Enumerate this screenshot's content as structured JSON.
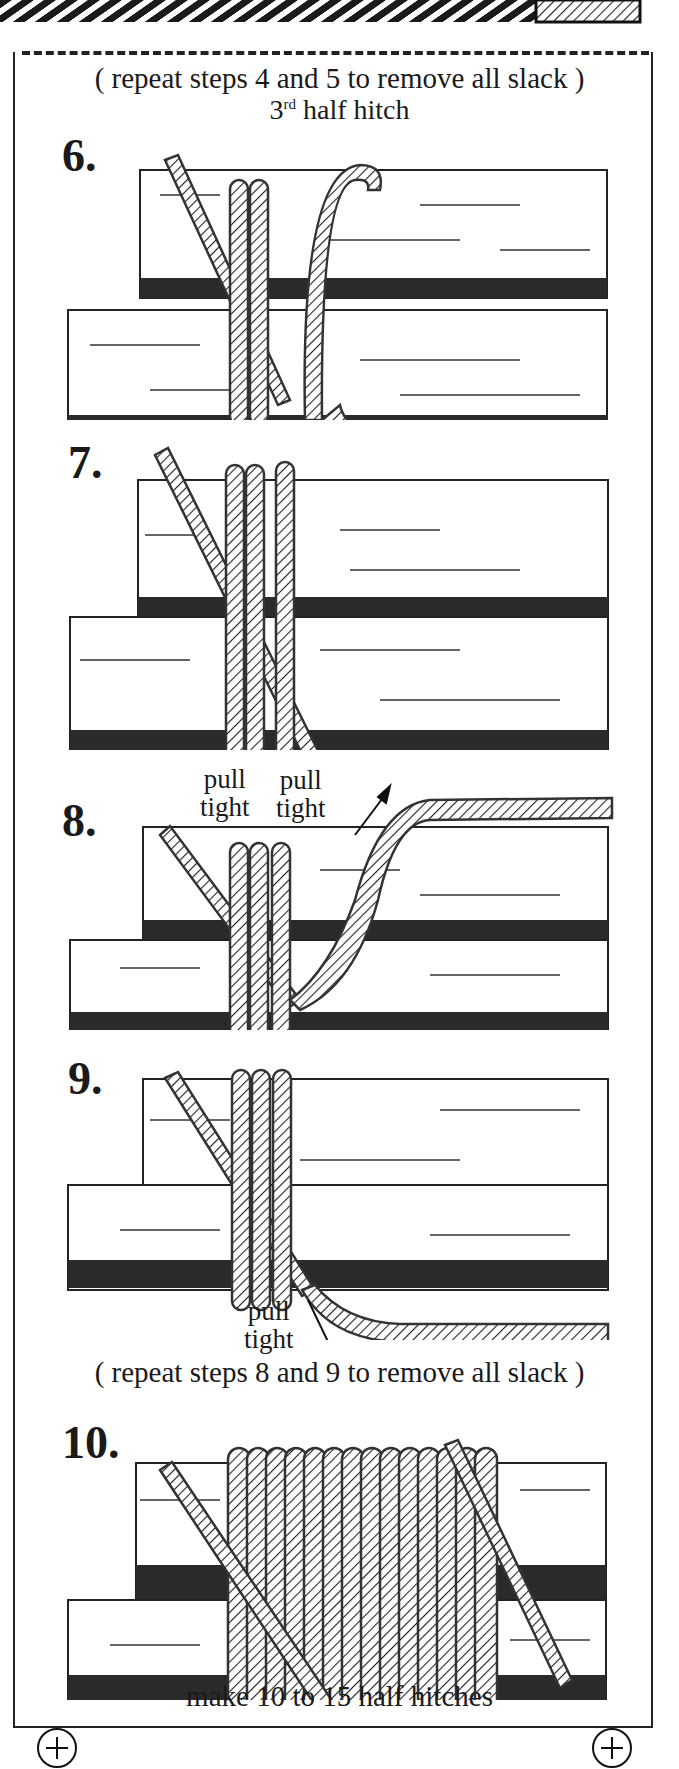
{
  "header": {
    "repeat_note": "( repeat steps 4 and 5 to remove all slack )",
    "subtitle_base": "3",
    "subtitle_sup": "rd",
    "subtitle_rest": " half hitch"
  },
  "steps": [
    {
      "number": "6.",
      "labels": []
    },
    {
      "number": "7.",
      "labels": [
        {
          "line1": "pull",
          "line2": "tight"
        }
      ]
    },
    {
      "number": "8.",
      "labels": [
        {
          "line1": "pull",
          "line2": "tight"
        }
      ]
    },
    {
      "number": "9.",
      "labels": [
        {
          "line1": "pull",
          "line2": "tight"
        }
      ]
    },
    {
      "number": "10.",
      "labels": []
    }
  ],
  "notes": {
    "repeat_8_9": "( repeat steps 8 and 9 to remove all slack )",
    "footer": "make 10 to 15 half hitches"
  },
  "icons": {
    "screw_left": "screw-plus-icon",
    "screw_right": "screw-plus-icon"
  },
  "colors": {
    "ink": "#1a1a1a",
    "paper": "#ffffff",
    "wood_dark": "#2a2a2a"
  }
}
